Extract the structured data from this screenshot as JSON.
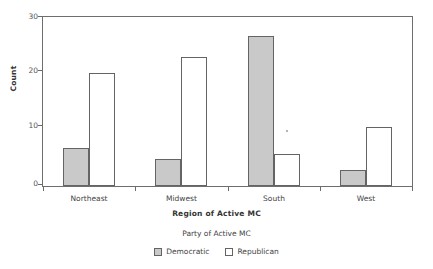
{
  "chart_data": {
    "type": "bar",
    "title": "",
    "xlabel": "Region of Active MC",
    "ylabel": "Count",
    "categories": [
      "Northeast",
      "Midwest",
      "South",
      "West"
    ],
    "series": [
      {
        "name": "Democratic",
        "values": [
          7,
          5,
          28,
          3
        ],
        "color": "#c9c9c9"
      },
      {
        "name": "Republican",
        "values": [
          21,
          24,
          6,
          11
        ],
        "color": "#ffffff"
      }
    ],
    "ylim": [
      0,
      31.5
    ],
    "yticks": [
      0,
      10,
      20,
      30
    ],
    "ytick_labels": [
      "0",
      "10",
      "20",
      "30"
    ],
    "grid": false,
    "legend_title": "Party of Active MC",
    "legend_position": "bottom",
    "frame": true
  },
  "axes": {
    "y_title": "Count",
    "x_title": "Region of Active MC",
    "y_tick_0": "0",
    "y_tick_1": "10",
    "y_tick_2": "20",
    "y_tick_3": "30",
    "x_cat_0": "Northeast",
    "x_cat_1": "Midwest",
    "x_cat_2": "South",
    "x_cat_3": "West"
  },
  "legend": {
    "title": "Party of Active MC",
    "items": [
      {
        "label": "Democratic",
        "swatch": "gray-filled-square"
      },
      {
        "label": "Republican",
        "swatch": "white-filled-square"
      }
    ]
  },
  "colors": {
    "democratic_fill": "#c9c9c9",
    "republican_fill": "#ffffff",
    "bar_outline": "#646464",
    "frame": "#6e6e6e",
    "text": "#444444"
  }
}
